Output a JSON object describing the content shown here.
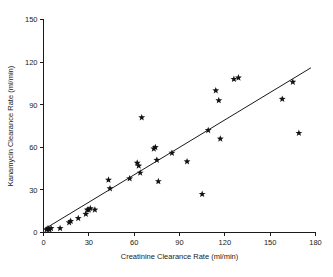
{
  "chart_data": {
    "type": "scatter",
    "title": "",
    "xlabel": "Creatinine Clearance Rate (ml/min)",
    "ylabel": "Kanamycin Clearance Rate (ml/min)",
    "xlim": [
      0,
      180
    ],
    "ylim": [
      0,
      150
    ],
    "xticks": [
      0,
      30,
      60,
      90,
      120,
      150,
      180
    ],
    "yticks": [
      0,
      30,
      60,
      90,
      120,
      150
    ],
    "xtick_labels": [
      "0",
      "30",
      "60",
      "90",
      "120",
      "150",
      "180"
    ],
    "ytick_labels": [
      "0",
      "30",
      "60",
      "90",
      "120",
      "150"
    ],
    "grid": false,
    "legend": false,
    "marker": "star",
    "marker_color": "#111111",
    "series": [
      {
        "name": "Patients",
        "points": [
          [
            2,
            2
          ],
          [
            3,
            3
          ],
          [
            4,
            2
          ],
          [
            5,
            3
          ],
          [
            11,
            3
          ],
          [
            17,
            7
          ],
          [
            18,
            8
          ],
          [
            23,
            10
          ],
          [
            28,
            13
          ],
          [
            29,
            16
          ],
          [
            30,
            16
          ],
          [
            31,
            17
          ],
          [
            34,
            16
          ],
          [
            43,
            37
          ],
          [
            44,
            31
          ],
          [
            57,
            38
          ],
          [
            62,
            49
          ],
          [
            63,
            47
          ],
          [
            64,
            42
          ],
          [
            65,
            81
          ],
          [
            73,
            59
          ],
          [
            74,
            60
          ],
          [
            75,
            51
          ],
          [
            76,
            36
          ],
          [
            85,
            56
          ],
          [
            95,
            50
          ],
          [
            105,
            27
          ],
          [
            109,
            72
          ],
          [
            114,
            100
          ],
          [
            116,
            93
          ],
          [
            117,
            66
          ],
          [
            126,
            108
          ],
          [
            129,
            109
          ],
          [
            158,
            94
          ],
          [
            165,
            106
          ],
          [
            169,
            70
          ]
        ]
      }
    ],
    "fit_line": {
      "name": "regression-line",
      "x_start": 0,
      "y_start": 2,
      "x_end": 177,
      "y_end": 116,
      "color": "#1a1a1a"
    }
  },
  "axes": {
    "x_axis_name": "x-axis",
    "y_axis_name": "y-axis"
  }
}
